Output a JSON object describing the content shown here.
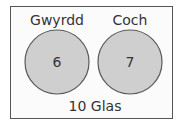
{
  "diagram": {
    "type": "venn",
    "sets": [
      {
        "name": "Gwyrdd",
        "value": "6"
      },
      {
        "name": "Coch",
        "value": "7"
      }
    ],
    "outside": "10 Glas",
    "colors": {
      "circle_fill": "#cfcfcf",
      "circle_stroke": "#5a5a5a",
      "border": "#555555",
      "text": "#333333"
    }
  }
}
